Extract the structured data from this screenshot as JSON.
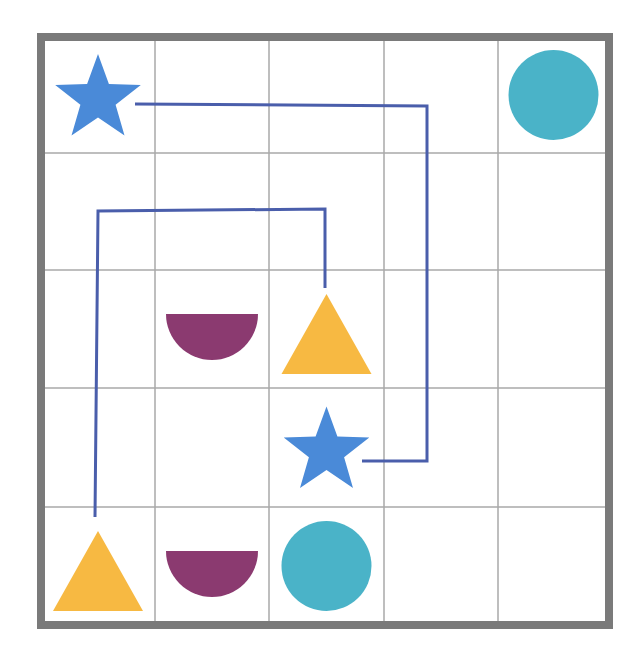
{
  "puzzle": {
    "rows": 5,
    "cols": 5,
    "colors": {
      "border": "#7a7a7a",
      "grid_line": "#a8a8a8",
      "path": "#4a5eab",
      "star": "#4a8ad8",
      "circle": "#4ab3c8",
      "triangle": "#f7b942",
      "semicircle": "#8b3a70"
    },
    "shapes": [
      {
        "type": "star",
        "row": 0,
        "col": 0
      },
      {
        "type": "circle",
        "row": 0,
        "col": 4
      },
      {
        "type": "semicircle",
        "row": 2,
        "col": 1
      },
      {
        "type": "triangle",
        "row": 2,
        "col": 2
      },
      {
        "type": "star",
        "row": 3,
        "col": 2
      },
      {
        "type": "triangle",
        "row": 4,
        "col": 0
      },
      {
        "type": "semicircle",
        "row": 4,
        "col": 1
      },
      {
        "type": "circle",
        "row": 4,
        "col": 2
      }
    ],
    "connections": [
      {
        "name": "star-to-star",
        "points": [
          [
            135,
            104
          ],
          [
            427,
            106
          ],
          [
            427,
            461
          ],
          [
            362,
            461
          ]
        ]
      },
      {
        "name": "triangle-to-triangle",
        "points": [
          [
            325,
            288
          ],
          [
            325,
            209
          ],
          [
            98,
            211
          ],
          [
            95,
            517
          ]
        ]
      }
    ]
  }
}
